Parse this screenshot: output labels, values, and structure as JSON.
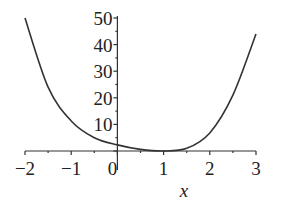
{
  "chart_data": {
    "type": "line",
    "title": "",
    "xlabel": "x",
    "ylabel": "",
    "xlim": [
      -2,
      3
    ],
    "ylim": [
      0,
      50
    ],
    "grid": false,
    "legend": null,
    "x_ticks": [
      "−2",
      "−1",
      "0",
      "1",
      "2",
      "3"
    ],
    "y_ticks": [
      "10",
      "20",
      "30",
      "40",
      "50"
    ],
    "series": [
      {
        "name": "f(x)",
        "x": [
          -2,
          -1.5,
          -1,
          -0.5,
          0,
          0.5,
          1,
          1.5,
          2,
          2.5,
          3
        ],
        "values": [
          50,
          24,
          11.3,
          5,
          2.3,
          0.6,
          0,
          1,
          6.8,
          21,
          44
        ]
      }
    ]
  },
  "colors": {
    "curve": "#333333",
    "axis": "#333333",
    "text": "#222222"
  }
}
